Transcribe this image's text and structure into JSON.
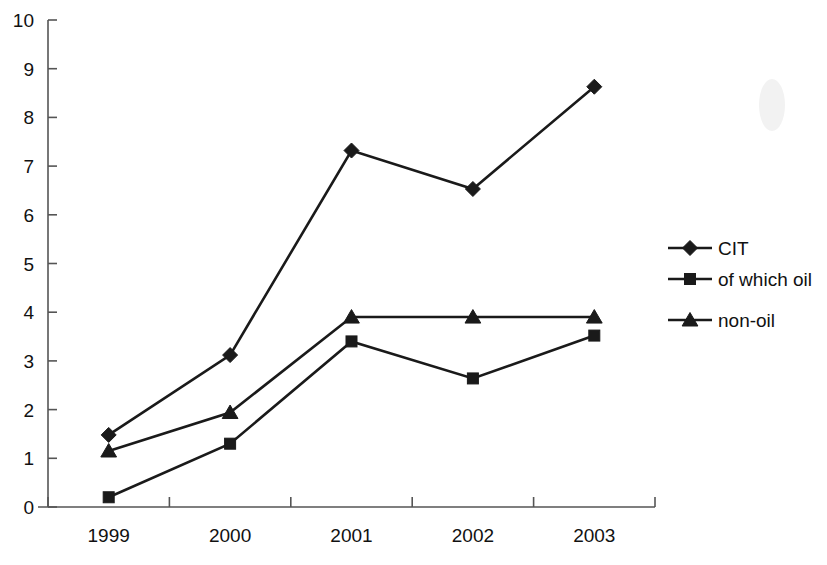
{
  "chart_data": {
    "type": "line",
    "title": "",
    "subtitle": "",
    "xlabel": "",
    "ylabel": "",
    "categories": [
      "1999",
      "2000",
      "2001",
      "2002",
      "2003"
    ],
    "x_tick_labels": [
      "1999",
      "2000",
      "2001",
      "2002",
      "2003"
    ],
    "y_tick_labels": [
      "0",
      "1",
      "2",
      "3",
      "4",
      "5",
      "6",
      "7",
      "8",
      "9",
      "10"
    ],
    "y_ticks": [
      0,
      1,
      2,
      3,
      4,
      5,
      6,
      7,
      8,
      9,
      10
    ],
    "ylim": [
      0,
      10
    ],
    "grid": false,
    "legend_position": "right",
    "series": [
      {
        "name": "CIT",
        "marker": "diamond",
        "color": "#1a1a1a",
        "values": [
          1.48,
          3.12,
          7.32,
          6.53,
          8.63
        ]
      },
      {
        "name": "of which oil",
        "marker": "square",
        "color": "#1a1a1a",
        "values": [
          0.2,
          1.3,
          3.4,
          2.64,
          3.52
        ]
      },
      {
        "name": "non-oil",
        "marker": "triangle",
        "color": "#1a1a1a",
        "values": [
          1.15,
          1.94,
          3.9,
          3.9,
          3.9
        ]
      }
    ]
  },
  "legend": {
    "items": [
      {
        "label": "CIT",
        "marker": "diamond"
      },
      {
        "label": "of which oil",
        "marker": "square"
      },
      {
        "label": "non-oil",
        "marker": "triangle"
      }
    ]
  },
  "axes": {
    "y_axis_name": "value-axis",
    "x_axis_name": "year-axis"
  },
  "colors": {
    "line": "#1a1a1a",
    "axis": "#555555",
    "text": "#111111",
    "background": "#ffffff"
  }
}
